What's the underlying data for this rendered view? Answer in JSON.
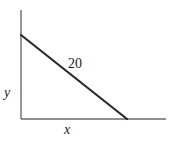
{
  "diagram": {
    "type": "linear-function",
    "axes": {
      "x_label": "x",
      "y_label": "y",
      "origin": [
        21,
        119
      ],
      "x_axis_end": [
        166,
        119
      ],
      "y_axis_end": [
        21,
        10
      ]
    },
    "line": {
      "label": "20",
      "start": [
        21,
        35
      ],
      "end": [
        127,
        119
      ]
    },
    "colors": {
      "axis": "#6a6a6a",
      "line": "#2a2a2a",
      "text": "#222222",
      "background": "#ffffff"
    }
  }
}
